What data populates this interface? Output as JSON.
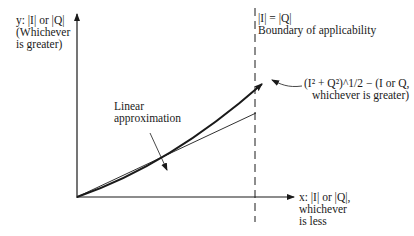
{
  "diagram": {
    "y_axis_label": {
      "line1": "y: |I| or |Q|",
      "line2": "(Whichever",
      "line3": "is greater)"
    },
    "boundary_label": {
      "line1": "|I| = |Q|",
      "line2": "Boundary of applicability"
    },
    "curve_label": {
      "line1": "(I² + Q²)^1/2 − (I or Q,",
      "line2": "whichever is greater)"
    },
    "linear_label": {
      "line1": "Linear",
      "line2": "approximation"
    },
    "x_axis_label": {
      "line1": "x: |I| or |Q|,",
      "line2": "whichever",
      "line3": "is less"
    },
    "colors": {
      "ink": "#1a1a1a",
      "background": "#ffffff"
    }
  }
}
